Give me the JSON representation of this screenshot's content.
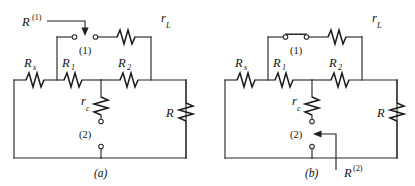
{
  "figure": {
    "background_color": "#ffffff",
    "line_color": "#2b2b2b",
    "panels": [
      {
        "id": "panel-a",
        "caption": "(a)",
        "switch_state": "open",
        "components": [
          {
            "name": "Rs",
            "base": "R",
            "sub": "s",
            "sup": "",
            "orientation": "horizontal"
          },
          {
            "name": "R1",
            "base": "R",
            "sub": "1",
            "sup": "",
            "orientation": "horizontal"
          },
          {
            "name": "R2",
            "base": "R",
            "sub": "2",
            "sup": "",
            "orientation": "horizontal"
          },
          {
            "name": "rL",
            "base": "r",
            "sub": "L",
            "sup": "",
            "orientation": "horizontal"
          },
          {
            "name": "rc",
            "base": "r",
            "sub": "c",
            "sup": "",
            "orientation": "vertical"
          },
          {
            "name": "R",
            "base": "R",
            "sub": "",
            "sup": "",
            "orientation": "vertical"
          }
        ],
        "nodes": [
          {
            "name": "node-1",
            "label": "(1)",
            "state": "open-gap"
          },
          {
            "name": "node-2",
            "label": "(2)",
            "state": "open-gap"
          }
        ],
        "callouts": [
          {
            "name": "callout-R1sup",
            "base": "R",
            "sup": "(1)",
            "points_to": "node-1"
          }
        ]
      },
      {
        "id": "panel-b",
        "caption": "(b)",
        "switch_state": "closed",
        "components": [
          {
            "name": "Rs",
            "base": "R",
            "sub": "s",
            "sup": "",
            "orientation": "horizontal"
          },
          {
            "name": "R1",
            "base": "R",
            "sub": "1",
            "sup": "",
            "orientation": "horizontal"
          },
          {
            "name": "R2",
            "base": "R",
            "sub": "2",
            "sup": "",
            "orientation": "horizontal"
          },
          {
            "name": "rL",
            "base": "r",
            "sub": "L",
            "sup": "",
            "orientation": "horizontal"
          },
          {
            "name": "rc",
            "base": "r",
            "sub": "c",
            "sup": "",
            "orientation": "vertical"
          },
          {
            "name": "R",
            "base": "R",
            "sub": "",
            "sup": "",
            "orientation": "vertical"
          }
        ],
        "nodes": [
          {
            "name": "node-1",
            "label": "(1)",
            "state": "closed-switch"
          },
          {
            "name": "node-2",
            "label": "(2)",
            "state": "open-gap"
          }
        ],
        "callouts": [
          {
            "name": "callout-R2sup",
            "base": "R",
            "sup": "(2)",
            "points_to": "node-2"
          }
        ]
      }
    ]
  },
  "labels": {
    "a": {
      "callout_R": "R",
      "callout_sup": "(1)",
      "rL": "r",
      "rL_sub": "L",
      "node1": "(1)",
      "Rs": "R",
      "Rs_sub": "s",
      "R1": "R",
      "R1_sub": "1",
      "R2": "R",
      "R2_sub": "2",
      "rc": "r",
      "rc_sub": "c",
      "node2": "(2)",
      "R": "R",
      "caption": "(a)"
    },
    "b": {
      "rL": "r",
      "rL_sub": "L",
      "node1": "(1)",
      "Rs": "R",
      "Rs_sub": "s",
      "R1": "R",
      "R1_sub": "1",
      "R2": "R",
      "R2_sub": "2",
      "rc": "r",
      "rc_sub": "c",
      "node2": "(2)",
      "R": "R",
      "caption": "(b)",
      "callout_R": "R",
      "callout_sup": "(2)"
    }
  }
}
